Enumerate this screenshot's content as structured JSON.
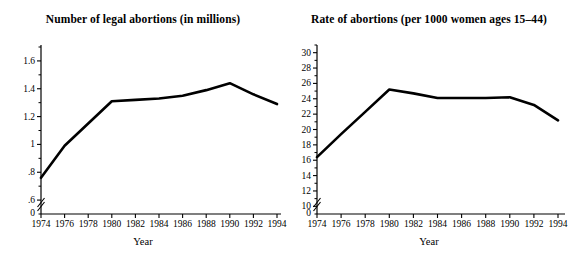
{
  "figure": {
    "background": "#ffffff",
    "line_color": "#000000",
    "axis_color": "#000000"
  },
  "chart_data": [
    {
      "type": "line",
      "panel": "left",
      "title": "Number of legal abortions (in millions)",
      "xlabel": "Year",
      "ylabel": "",
      "x": [
        1974,
        1976,
        1978,
        1980,
        1982,
        1984,
        1986,
        1988,
        1990,
        1992,
        1994
      ],
      "values": [
        0.76,
        0.99,
        1.15,
        1.31,
        1.32,
        1.33,
        1.35,
        1.39,
        1.44,
        1.36,
        1.29
      ],
      "series": [
        {
          "name": "Number of legal abortions (in millions)",
          "values": [
            0.76,
            0.99,
            1.15,
            1.31,
            1.32,
            1.33,
            1.35,
            1.39,
            1.44,
            1.36,
            1.29
          ]
        }
      ],
      "xlim": [
        1974,
        1994
      ],
      "ylim": [
        0.5,
        1.7
      ],
      "xticks": [
        1974,
        1976,
        1978,
        1980,
        1982,
        1984,
        1986,
        1988,
        1990,
        1992,
        1994
      ],
      "xticklabels": [
        "1974",
        "1976",
        "1978",
        "1980",
        "1982",
        "1984",
        "1986",
        "1988",
        "1990",
        "1992",
        "1994"
      ],
      "yticks": [
        0.6,
        0.8,
        1.0,
        1.2,
        1.4,
        1.6
      ],
      "yticklabels": [
        ".6",
        ".8",
        "1",
        "1.2",
        "1.4",
        "1.6"
      ],
      "yminorticks": [
        0.5,
        0.7,
        0.9,
        1.1,
        1.3,
        1.5,
        1.7
      ],
      "zero_label": "0",
      "axis_break": true,
      "grid": false,
      "legend": "none"
    },
    {
      "type": "line",
      "panel": "right",
      "title": "Rate of abortions (per 1000 women ages 15–44)",
      "xlabel": "Year",
      "ylabel": "",
      "x": [
        1974,
        1976,
        1978,
        1980,
        1982,
        1984,
        1986,
        1988,
        1990,
        1992,
        1994
      ],
      "values": [
        16.4,
        19.4,
        22.3,
        25.2,
        24.7,
        24.1,
        24.1,
        24.1,
        24.2,
        23.2,
        21.2
      ],
      "series": [
        {
          "name": "Rate of abortions (per 1000 women ages 15-44)",
          "values": [
            16.4,
            19.4,
            22.3,
            25.2,
            24.7,
            24.1,
            24.1,
            24.1,
            24.2,
            23.2,
            21.2
          ]
        }
      ],
      "xlim": [
        1974,
        1994
      ],
      "ylim": [
        9,
        31
      ],
      "xticks": [
        1974,
        1976,
        1978,
        1980,
        1982,
        1984,
        1986,
        1988,
        1990,
        1992,
        1994
      ],
      "xticklabels": [
        "1974",
        "1976",
        "1978",
        "1980",
        "1982",
        "1984",
        "1986",
        "1988",
        "1990",
        "1992",
        "1994"
      ],
      "yticks": [
        10,
        12,
        14,
        16,
        18,
        20,
        22,
        24,
        26,
        28,
        30
      ],
      "yticklabels": [
        "10",
        "12",
        "14",
        "16",
        "18",
        "20",
        "22",
        "24",
        "26",
        "28",
        "30"
      ],
      "yminorticks": [
        9,
        11,
        13,
        15,
        17,
        19,
        21,
        23,
        25,
        27,
        29,
        31
      ],
      "zero_label": "0",
      "axis_break": true,
      "grid": false,
      "legend": "none"
    }
  ]
}
